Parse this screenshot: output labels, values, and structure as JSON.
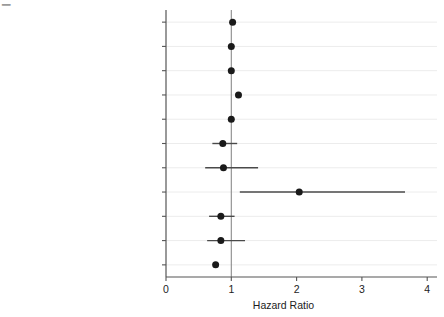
{
  "figure": {
    "corner_artifact": "▁",
    "background_color": "#ffffff",
    "marker_color": "#1a1a1a",
    "line_color": "#4a4a4a",
    "grid_color": "#ececec",
    "axis_color": "#555555"
  },
  "chart_data": {
    "type": "scatter",
    "title": "",
    "subtitle": "",
    "xlabel": "Hazard Ratio",
    "ylabel": "",
    "xlim": [
      0,
      4.15
    ],
    "xticks": [
      0,
      1,
      2,
      3,
      4
    ],
    "xtick_labels": [
      "0",
      "1",
      "2",
      "3",
      "4"
    ],
    "grid": true,
    "legend": null,
    "reference_line": 1,
    "orientation": "horizontal",
    "categories": [
      "Ln(Refugee Inflows)",
      "Ln(Total Refugee Outflows)",
      "Democracy",
      "Ln(GDPpc)",
      "Ln(Population)",
      "P5",
      "Contiguous",
      "Joint Ethnicity",
      "Alliance",
      "Colonial Ties",
      "Ln(Other Contributors)"
    ],
    "values": [
      1.02,
      1.0,
      1.0,
      1.11,
      1.0,
      0.87,
      0.88,
      2.04,
      0.84,
      0.84,
      0.76
    ],
    "ci_low": [
      1.0,
      0.99,
      0.99,
      1.09,
      0.99,
      0.71,
      0.6,
      1.13,
      0.66,
      0.63,
      0.73
    ],
    "ci_high": [
      1.04,
      1.01,
      1.01,
      1.13,
      1.01,
      1.09,
      1.41,
      3.66,
      1.05,
      1.21,
      0.8
    ],
    "points": [
      {
        "label": "Ln(Refugee Inflows)",
        "hazard_ratio": 1.02,
        "ci_low": 1.0,
        "ci_high": 1.04
      },
      {
        "label": "Ln(Total Refugee Outflows)",
        "hazard_ratio": 1.0,
        "ci_low": 0.99,
        "ci_high": 1.01
      },
      {
        "label": "Democracy",
        "hazard_ratio": 1.0,
        "ci_low": 0.99,
        "ci_high": 1.01
      },
      {
        "label": "Ln(GDPpc)",
        "hazard_ratio": 1.11,
        "ci_low": 1.09,
        "ci_high": 1.13
      },
      {
        "label": "Ln(Population)",
        "hazard_ratio": 1.0,
        "ci_low": 0.99,
        "ci_high": 1.01
      },
      {
        "label": "P5",
        "hazard_ratio": 0.87,
        "ci_low": 0.71,
        "ci_high": 1.09
      },
      {
        "label": "Contiguous",
        "hazard_ratio": 0.88,
        "ci_low": 0.6,
        "ci_high": 1.41
      },
      {
        "label": "Joint Ethnicity",
        "hazard_ratio": 2.04,
        "ci_low": 1.13,
        "ci_high": 3.66
      },
      {
        "label": "Alliance",
        "hazard_ratio": 0.84,
        "ci_low": 0.66,
        "ci_high": 1.05
      },
      {
        "label": "Colonial Ties",
        "hazard_ratio": 0.84,
        "ci_low": 0.63,
        "ci_high": 1.21
      },
      {
        "label": "Ln(Other Contributors)",
        "hazard_ratio": 0.76,
        "ci_low": 0.73,
        "ci_high": 0.8
      }
    ]
  }
}
